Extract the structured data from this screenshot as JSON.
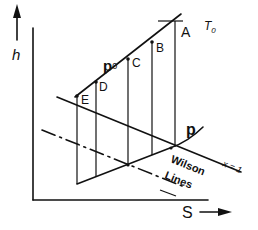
{
  "diagram": {
    "axes": {
      "y_label": "h",
      "x_label": "S"
    },
    "labels": {
      "T0": "T",
      "T0_sub": "0",
      "p0": "p",
      "p0_sub": "0",
      "p": "p",
      "x1": "x = 1",
      "wilson_line1": "Wilson",
      "wilson_line2": "Lines"
    },
    "points": [
      {
        "id": "A",
        "label": "A"
      },
      {
        "id": "B",
        "label": "B"
      },
      {
        "id": "C",
        "label": "C"
      },
      {
        "id": "D",
        "label": "D"
      },
      {
        "id": "E",
        "label": "E"
      }
    ],
    "colors": {
      "line": "#111111",
      "background": "#ffffff"
    }
  }
}
